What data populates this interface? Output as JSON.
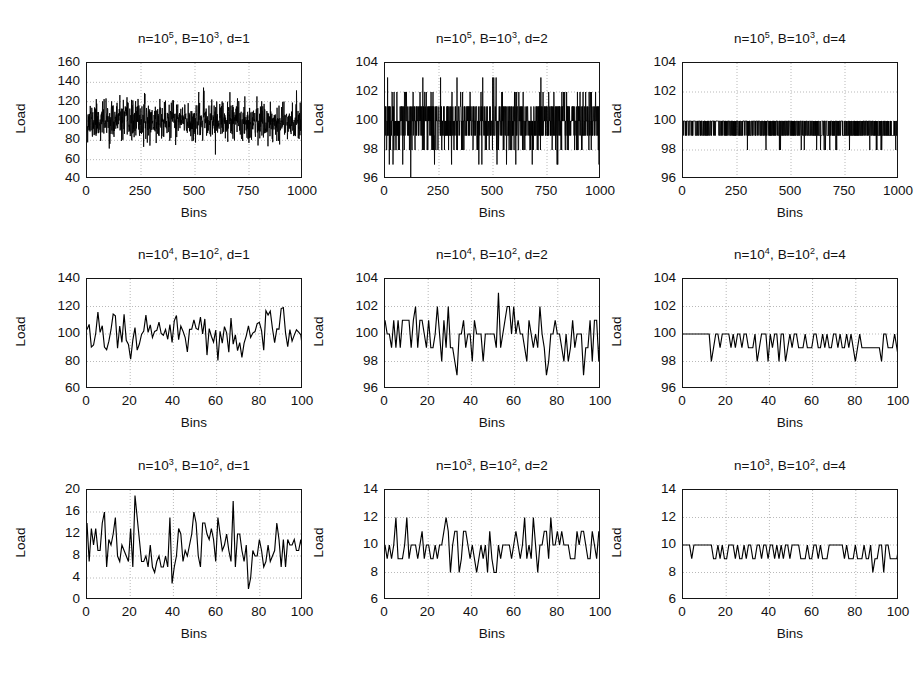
{
  "figure": {
    "caption": "",
    "axis_label_y": "Load",
    "axis_label_x": "Bins"
  },
  "chart_data": [
    {
      "id": "panel-1-1",
      "type": "line",
      "title": "n=10^5, B=10^3, d=1",
      "title_parts": {
        "n_base": "n=10",
        "n_exp": "5",
        "b_base": ", B=10",
        "b_exp": "3",
        "d": ", d=1"
      },
      "xlabel": "Bins",
      "ylabel": "Load",
      "xlim": [
        0,
        1000
      ],
      "ylim": [
        40,
        160
      ],
      "xticks": [
        0,
        250,
        500,
        750,
        1000
      ],
      "yticks": [
        40,
        60,
        80,
        100,
        120,
        140,
        160
      ],
      "grid": true,
      "n": 100000,
      "B": 1000,
      "d": 1,
      "mean_load": 100,
      "noise_sd": 10,
      "seed": 11,
      "series": [
        {
          "name": "load",
          "color": "#000000"
        }
      ]
    },
    {
      "id": "panel-1-2",
      "type": "line",
      "title": "n=10^5, B=10^3, d=2",
      "title_parts": {
        "n_base": "n=10",
        "n_exp": "5",
        "b_base": ", B=10",
        "b_exp": "3",
        "d": ", d=2"
      },
      "xlabel": "Bins",
      "ylabel": "Load",
      "xlim": [
        0,
        1000
      ],
      "ylim": [
        96,
        104
      ],
      "xticks": [
        0,
        250,
        500,
        750,
        1000
      ],
      "yticks": [
        96,
        98,
        100,
        102,
        104
      ],
      "grid": true,
      "n": 100000,
      "B": 1000,
      "d": 2,
      "mean_load": 100,
      "noise_sd": 1.05,
      "quantized": 1,
      "seed": 22,
      "series": [
        {
          "name": "load",
          "color": "#000000"
        }
      ]
    },
    {
      "id": "panel-1-3",
      "type": "line",
      "title": "n=10^5, B=10^3, d=4",
      "title_parts": {
        "n_base": "n=10",
        "n_exp": "5",
        "b_base": ", B=10",
        "b_exp": "3",
        "d": ", d=4"
      },
      "xlabel": "Bins",
      "ylabel": "Load",
      "xlim": [
        0,
        1000
      ],
      "ylim": [
        96,
        104
      ],
      "xticks": [
        0,
        250,
        500,
        750,
        1000
      ],
      "yticks": [
        96,
        98,
        100,
        102,
        104
      ],
      "grid": true,
      "n": 100000,
      "B": 1000,
      "d": 4,
      "mean_load": 100,
      "noise_sd": 0.5,
      "quantized": 1,
      "seed": 33,
      "series": [
        {
          "name": "load",
          "color": "#000000"
        }
      ]
    },
    {
      "id": "panel-2-1",
      "type": "line",
      "title": "n=10^4, B=10^2, d=1",
      "title_parts": {
        "n_base": "n=10",
        "n_exp": "4",
        "b_base": ", B=10",
        "b_exp": "2",
        "d": ", d=1"
      },
      "xlabel": "Bins",
      "ylabel": "Load",
      "xlim": [
        0,
        100
      ],
      "ylim": [
        60,
        140
      ],
      "xticks": [
        0,
        20,
        40,
        60,
        80,
        100
      ],
      "yticks": [
        60,
        80,
        100,
        120,
        140
      ],
      "grid": true,
      "n": 10000,
      "B": 100,
      "d": 1,
      "mean_load": 100,
      "noise_sd": 10,
      "seed": 44,
      "series": [
        {
          "name": "load",
          "color": "#000000"
        }
      ]
    },
    {
      "id": "panel-2-2",
      "type": "line",
      "title": "n=10^4, B=10^2, d=2",
      "title_parts": {
        "n_base": "n=10",
        "n_exp": "4",
        "b_base": ", B=10",
        "b_exp": "2",
        "d": ", d=2"
      },
      "xlabel": "Bins",
      "ylabel": "Load",
      "xlim": [
        0,
        100
      ],
      "ylim": [
        96,
        104
      ],
      "xticks": [
        0,
        20,
        40,
        60,
        80,
        100
      ],
      "yticks": [
        96,
        98,
        100,
        102,
        104
      ],
      "grid": true,
      "n": 10000,
      "B": 100,
      "d": 2,
      "mean_load": 100,
      "noise_sd": 1.1,
      "quantized": 1,
      "seed": 55,
      "series": [
        {
          "name": "load",
          "color": "#000000"
        }
      ]
    },
    {
      "id": "panel-2-3",
      "type": "line",
      "title": "n=10^4, B=10^2, d=4",
      "title_parts": {
        "n_base": "n=10",
        "n_exp": "4",
        "b_base": ", B=10",
        "b_exp": "2",
        "d": ", d=4"
      },
      "xlabel": "Bins",
      "ylabel": "Load",
      "xlim": [
        0,
        100
      ],
      "ylim": [
        96,
        104
      ],
      "xticks": [
        0,
        20,
        40,
        60,
        80,
        100
      ],
      "yticks": [
        96,
        98,
        100,
        102,
        104
      ],
      "grid": true,
      "n": 10000,
      "B": 100,
      "d": 4,
      "mean_load": 100,
      "noise_sd": 0.55,
      "quantized": 1,
      "seed": 66,
      "series": [
        {
          "name": "load",
          "color": "#000000"
        }
      ]
    },
    {
      "id": "panel-3-1",
      "type": "line",
      "title": "n=10^3, B=10^2, d=1",
      "title_parts": {
        "n_base": "n=10",
        "n_exp": "3",
        "b_base": ", B=10",
        "b_exp": "2",
        "d": ", d=1"
      },
      "xlabel": "Bins",
      "ylabel": "Load",
      "xlim": [
        0,
        100
      ],
      "ylim": [
        0,
        20
      ],
      "xticks": [
        0,
        20,
        40,
        60,
        80,
        100
      ],
      "yticks": [
        0,
        4,
        8,
        12,
        16,
        20
      ],
      "grid": true,
      "n": 1000,
      "B": 100,
      "d": 1,
      "mean_load": 10,
      "noise_sd": 3.1,
      "quantized": 1,
      "seed": 77,
      "series": [
        {
          "name": "load",
          "color": "#000000"
        }
      ]
    },
    {
      "id": "panel-3-2",
      "type": "line",
      "title": "n=10^3, B=10^2, d=2",
      "title_parts": {
        "n_base": "n=10",
        "n_exp": "3",
        "b_base": ", B=10",
        "b_exp": "2",
        "d": ", d=2"
      },
      "xlabel": "Bins",
      "ylabel": "Load",
      "xlim": [
        0,
        100
      ],
      "ylim": [
        6,
        14
      ],
      "xticks": [
        0,
        20,
        40,
        60,
        80,
        100
      ],
      "yticks": [
        6,
        8,
        10,
        12,
        14
      ],
      "grid": true,
      "n": 1000,
      "B": 100,
      "d": 2,
      "mean_load": 10,
      "noise_sd": 0.95,
      "quantized": 1,
      "seed": 88,
      "series": [
        {
          "name": "load",
          "color": "#000000"
        }
      ]
    },
    {
      "id": "panel-3-3",
      "type": "line",
      "title": "n=10^3, B=10^2, d=4",
      "title_parts": {
        "n_base": "n=10",
        "n_exp": "3",
        "b_base": ", B=10",
        "b_exp": "2",
        "d": ", d=4"
      },
      "xlabel": "Bins",
      "ylabel": "Load",
      "xlim": [
        0,
        100
      ],
      "ylim": [
        6,
        14
      ],
      "xticks": [
        0,
        20,
        40,
        60,
        80,
        100
      ],
      "yticks": [
        6,
        8,
        10,
        12,
        14
      ],
      "grid": true,
      "n": 1000,
      "B": 100,
      "d": 4,
      "mean_load": 10,
      "noise_sd": 0.5,
      "quantized": 1,
      "seed": 99,
      "series": [
        {
          "name": "load",
          "color": "#000000"
        }
      ]
    }
  ],
  "layout": {
    "panels": [
      {
        "id": "panel-1-1",
        "box": {
          "left": 86,
          "top": 62,
          "width": 216,
          "height": 116
        }
      },
      {
        "id": "panel-1-2",
        "box": {
          "left": 384,
          "top": 62,
          "width": 216,
          "height": 116
        }
      },
      {
        "id": "panel-1-3",
        "box": {
          "left": 682,
          "top": 62,
          "width": 216,
          "height": 116
        }
      },
      {
        "id": "panel-2-1",
        "box": {
          "left": 86,
          "top": 278,
          "width": 216,
          "height": 110
        }
      },
      {
        "id": "panel-2-2",
        "box": {
          "left": 384,
          "top": 278,
          "width": 216,
          "height": 110
        }
      },
      {
        "id": "panel-2-3",
        "box": {
          "left": 682,
          "top": 278,
          "width": 216,
          "height": 110
        }
      },
      {
        "id": "panel-3-1",
        "box": {
          "left": 86,
          "top": 489,
          "width": 216,
          "height": 110
        }
      },
      {
        "id": "panel-3-2",
        "box": {
          "left": 384,
          "top": 489,
          "width": 216,
          "height": 110
        }
      },
      {
        "id": "panel-3-3",
        "box": {
          "left": 682,
          "top": 489,
          "width": 216,
          "height": 110
        }
      }
    ],
    "grid_color": "#b9b9b9",
    "line_color": "#000000",
    "axis_color": "#151515"
  }
}
